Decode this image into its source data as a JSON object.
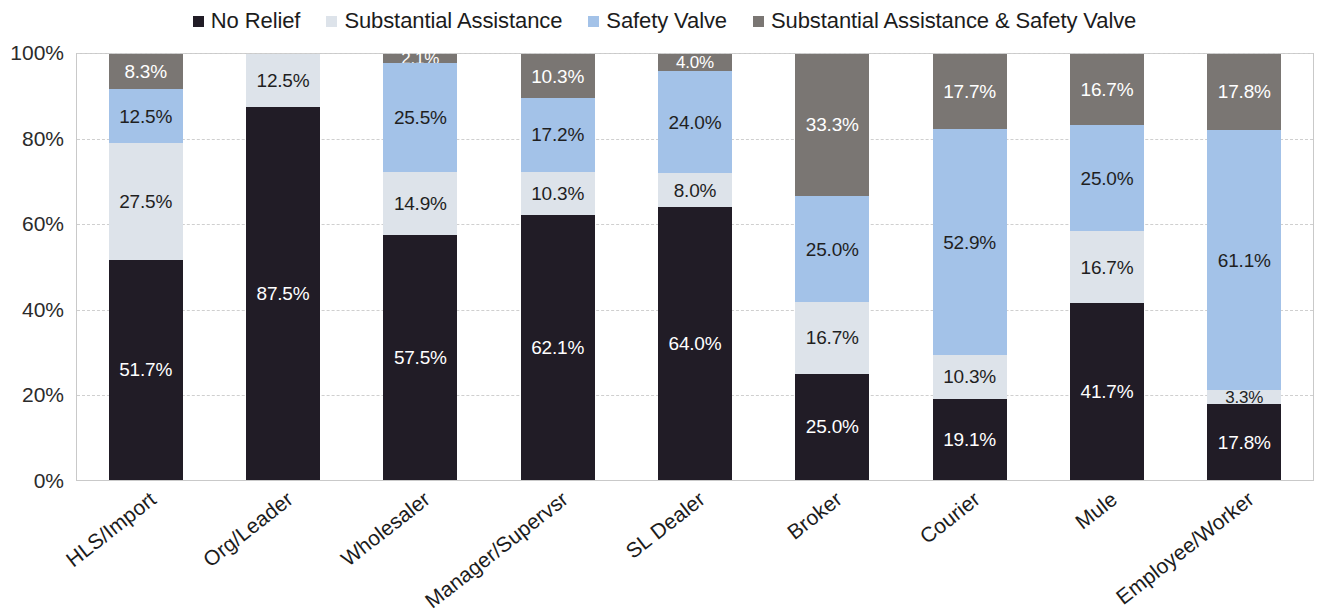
{
  "legend": {
    "position": "top-center",
    "items": [
      {
        "label": "No Relief",
        "color": "#211c26",
        "icon": "square-marker-icon"
      },
      {
        "label": "Substantial Assistance",
        "color": "#dde3ea",
        "icon": "square-marker-icon"
      },
      {
        "label": "Safety Valve",
        "color": "#a3c2e8",
        "icon": "square-marker-icon"
      },
      {
        "label": "Substantial Assistance & Safety Valve",
        "color": "#7a7673",
        "icon": "square-marker-icon"
      }
    ]
  },
  "y_axis": {
    "ticks": [
      "0%",
      "20%",
      "40%",
      "60%",
      "80%",
      "100%"
    ]
  },
  "footnote": {
    "text": ""
  },
  "chart_data": {
    "type": "bar",
    "stacked": true,
    "title": "",
    "subtitle": "",
    "xlabel": "",
    "ylabel": "",
    "ylim": [
      0,
      100
    ],
    "ytick_values": [
      0,
      20,
      40,
      60,
      80,
      100
    ],
    "ytick_labels": [
      "0%",
      "20%",
      "40%",
      "60%",
      "80%",
      "100%"
    ],
    "grid": "horizontal-dashed",
    "legend_position": "top-center",
    "categories": [
      "HLS/Import",
      "Org/Leader",
      "Wholesaler",
      "Manager/Supervsr",
      "SL Dealer",
      "Broker",
      "Courier",
      "Mule",
      "Employee/Worker"
    ],
    "series": [
      {
        "name": "No Relief",
        "color": "#211c26",
        "values": [
          51.7,
          87.5,
          57.5,
          62.1,
          64.0,
          25.0,
          19.1,
          41.7,
          17.8
        ],
        "labels": [
          "51.7%",
          "87.5%",
          "57.5%",
          "62.1%",
          "64.0%",
          "25.0%",
          "19.1%",
          "41.7%",
          "17.8%"
        ]
      },
      {
        "name": "Substantial Assistance",
        "color": "#dde3ea",
        "values": [
          27.5,
          12.5,
          14.9,
          10.3,
          8.0,
          16.7,
          10.3,
          16.7,
          3.3
        ],
        "labels": [
          "27.5%",
          "12.5%",
          "14.9%",
          "10.3%",
          "8.0%",
          "16.7%",
          "10.3%",
          "16.7%",
          "3.3%"
        ]
      },
      {
        "name": "Safety Valve",
        "color": "#a3c2e8",
        "values": [
          12.5,
          0,
          25.5,
          17.2,
          24.0,
          25.0,
          52.9,
          25.0,
          61.1
        ],
        "labels": [
          "12.5%",
          "",
          "25.5%",
          "17.2%",
          "24.0%",
          "25.0%",
          "52.9%",
          "25.0%",
          "61.1%"
        ]
      },
      {
        "name": "Substantial Assistance & Safety Valve",
        "color": "#7a7673",
        "values": [
          8.3,
          0,
          2.1,
          10.3,
          4.0,
          33.3,
          17.7,
          16.7,
          17.8
        ],
        "labels": [
          "8.3%",
          "",
          "2.1%",
          "10.3%",
          "4.0%",
          "33.3%",
          "17.7%",
          "16.7%",
          "17.8%"
        ]
      }
    ]
  }
}
